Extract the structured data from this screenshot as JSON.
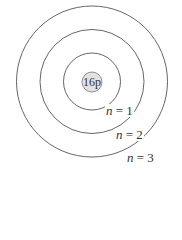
{
  "diagram": {
    "type": "bohr-model",
    "center": {
      "x": 92,
      "y": 81.5
    },
    "nucleus": {
      "label": "16p",
      "radius": 10,
      "fill": "#e2e2e2",
      "stroke": "#777777"
    },
    "shells": [
      {
        "n": 1,
        "radius": 28.5,
        "label_var": "n",
        "label_rest": " = 1",
        "label_x": 106,
        "label_y": 104
      },
      {
        "n": 2,
        "radius": 52,
        "label_var": "n",
        "label_rest": " = 2",
        "label_x": 116,
        "label_y": 128
      },
      {
        "n": 3,
        "radius": 75.5,
        "label_var": "n",
        "label_rest": " = 3",
        "label_x": 127,
        "label_y": 151
      }
    ],
    "stroke_color": "#555555"
  }
}
